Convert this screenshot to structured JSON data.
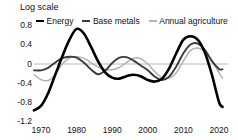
{
  "chart_data": {
    "type": "line",
    "title": "Log scale",
    "subtitle": "",
    "xlabel": "",
    "ylabel": "Log scale",
    "xlim": [
      1968,
      2021
    ],
    "ylim": [
      -1.2,
      0.8
    ],
    "grid": false,
    "zero_line": true,
    "legend_position": "top",
    "x_ticks": [
      "1970",
      "1980",
      "1990",
      "2000",
      "2010",
      "2020"
    ],
    "x_tick_values": [
      1970,
      1980,
      1990,
      2000,
      2010,
      2020
    ],
    "y_ticks": [
      "0.8",
      "0.4",
      "0",
      "-0.4",
      "-0.8",
      "-1.2"
    ],
    "y_tick_values": [
      0.8,
      0.4,
      0,
      -0.4,
      -0.8,
      -1.2
    ],
    "x": [
      1968,
      1970,
      1972,
      1974,
      1976,
      1978,
      1980,
      1982,
      1984,
      1986,
      1988,
      1990,
      1992,
      1994,
      1996,
      1998,
      2000,
      2002,
      2004,
      2006,
      2008,
      2010,
      2012,
      2014,
      2016,
      2018,
      2020,
      2021
    ],
    "series": [
      {
        "name": "Energy",
        "color": "#000000",
        "width": 2.6,
        "values": [
          -0.95,
          -0.86,
          -0.6,
          -0.22,
          0.16,
          0.5,
          0.72,
          0.63,
          0.36,
          0.06,
          -0.17,
          -0.28,
          -0.3,
          -0.25,
          -0.22,
          -0.25,
          -0.33,
          -0.36,
          -0.3,
          -0.09,
          0.22,
          0.5,
          0.57,
          0.5,
          0.24,
          -0.22,
          -0.78,
          -0.88
        ]
      },
      {
        "name": "Base metals",
        "color": "#3b3b3b",
        "width": 1.9,
        "values": [
          -0.13,
          -0.13,
          -0.08,
          0.03,
          0.12,
          0.15,
          0.13,
          0.03,
          -0.11,
          -0.21,
          -0.14,
          0.02,
          0.13,
          0.14,
          0.07,
          -0.03,
          -0.13,
          -0.26,
          -0.33,
          -0.26,
          -0.05,
          0.22,
          0.4,
          0.42,
          0.29,
          0.06,
          -0.1,
          -0.11
        ]
      },
      {
        "name": "Annual agriculture",
        "color": "#b0b0b0",
        "width": 1.5,
        "values": [
          -0.22,
          -0.32,
          -0.34,
          -0.22,
          0.0,
          0.12,
          0.15,
          0.12,
          0.03,
          -0.06,
          -0.11,
          -0.12,
          -0.07,
          0.03,
          0.12,
          0.11,
          0.0,
          -0.16,
          -0.28,
          -0.29,
          -0.18,
          0.06,
          0.28,
          0.33,
          0.26,
          0.08,
          -0.18,
          -0.29
        ]
      }
    ]
  },
  "legend": {
    "items": [
      {
        "label": "Energy",
        "swatch": "line-swatch-energy"
      },
      {
        "label": "Base metals",
        "swatch": "line-swatch-base-metals"
      },
      {
        "label": "Annual agriculture",
        "swatch": "line-swatch-annual-agriculture"
      }
    ]
  },
  "axes": {
    "y_title": "Log scale",
    "y_labels": [
      "0.8",
      "0.4",
      "0",
      "-0.4",
      "-0.8",
      "-1.2"
    ],
    "x_labels": [
      "1970",
      "1980",
      "1990",
      "2000",
      "2010",
      "2020"
    ]
  },
  "colors": {
    "energy": "#000000",
    "base_metals": "#3b3b3b",
    "annual_agriculture": "#b0b0b0",
    "zero_line": "#b9b9b9",
    "text": "#111111",
    "background": "#ffffff"
  }
}
